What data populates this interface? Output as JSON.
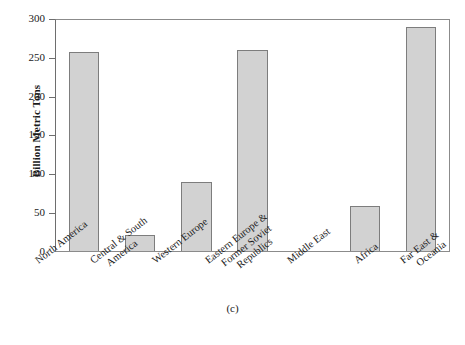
{
  "chart_data": {
    "type": "bar",
    "title": "",
    "subfigure_label": "(c)",
    "xlabel": "",
    "ylabel": "Billion Metric Tons",
    "ylim": [
      0,
      300
    ],
    "yticks": [
      0,
      50,
      100,
      150,
      200,
      250,
      300
    ],
    "grid": false,
    "legend": null,
    "bar_color": "#d2d2d2",
    "bar_edge_color": "#7d7d7d",
    "axis_color": "#6e6e6e",
    "categories": [
      "North America",
      "Central & South America",
      "Western Europe",
      "Eastern Europe & Former Soviet Republics",
      "Middle East",
      "Africa",
      "Far East & Oceania"
    ],
    "category_lines": [
      [
        "North America"
      ],
      [
        "Central & South",
        "America"
      ],
      [
        "Western Europe"
      ],
      [
        "Eastern Europe &",
        "Former Soviet",
        "Republics"
      ],
      [
        "Middle East"
      ],
      [
        "Africa"
      ],
      [
        "Far East &",
        "Oceania"
      ]
    ],
    "values": [
      258,
      21,
      89,
      261,
      0,
      59,
      291
    ]
  },
  "axis": {
    "ytick_labels": [
      "300",
      "250",
      "200",
      "150",
      "100",
      "50",
      "0"
    ],
    "ylabel_text": "Billion Metric Tons"
  },
  "caption": {
    "subfigure": "(c)"
  }
}
